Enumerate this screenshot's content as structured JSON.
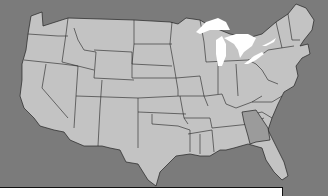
{
  "map": {
    "title": "United States map",
    "background_color": "#7b7b7b",
    "state_fill": "#c3c3c3",
    "highlight_fill": "#9b9b9b",
    "lake_fill": "#ffffff",
    "highlighted_states": [
      "Georgia"
    ]
  },
  "answer_box": {
    "text": ""
  }
}
